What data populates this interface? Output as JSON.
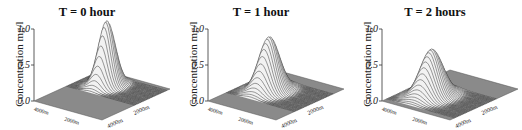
{
  "chart_data": [
    {
      "type": "surface",
      "title": "T = 0 hour",
      "zlabel": "Concentration mg/l",
      "zticks": [
        "0.0",
        "0.5",
        "1.0"
      ],
      "zlim": [
        0,
        1.0
      ],
      "xlabel_ticks": [
        "4000m",
        "2000m"
      ],
      "ylabel_ticks": [
        "4000m",
        "2000m"
      ],
      "peak": {
        "value": 0.9,
        "x": 0.72,
        "y": 0.35,
        "spread": 0.09
      }
    },
    {
      "type": "surface",
      "title": "T = 1 hour",
      "zlabel": "Concentration mg/l",
      "zticks": [
        "0.0",
        "0.5",
        "1.0"
      ],
      "zlim": [
        0,
        1.0
      ],
      "xlabel_ticks": [
        "4000m",
        "2000m"
      ],
      "ylabel_ticks": [
        "4000m",
        "2000m"
      ],
      "peak": {
        "value": 0.75,
        "x": 0.55,
        "y": 0.35,
        "spread": 0.11
      }
    },
    {
      "type": "surface",
      "title": "T = 2 hours",
      "zlabel": "Concentration mg/l",
      "zticks": [
        "0.0",
        "0.5",
        "1.0"
      ],
      "zlim": [
        0,
        1.0
      ],
      "xlabel_ticks": [
        "4000m",
        "2000m"
      ],
      "ylabel_ticks": [
        "4000m",
        "2000m"
      ],
      "peak": {
        "value": 0.65,
        "x": 0.38,
        "y": 0.35,
        "spread": 0.12
      }
    }
  ]
}
